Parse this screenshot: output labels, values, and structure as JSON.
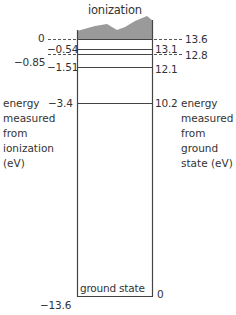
{
  "diagram": {
    "title": "ionization",
    "left_axis_label": [
      "energy",
      "measured",
      "from",
      "ionization",
      "(eV)"
    ],
    "right_axis_label": [
      "energy",
      "measured",
      "from",
      "ground",
      "state (eV)"
    ],
    "ground_state_label": "ground state",
    "levels": [
      {
        "left": "0",
        "right": "13.6",
        "dashed": true
      },
      {
        "left": "−0.54",
        "right": "13.1",
        "dashed": false
      },
      {
        "left": "−0.85",
        "right": "12.8",
        "dashed": true
      },
      {
        "left": "−1.51",
        "right": "12.1",
        "dashed": false
      },
      {
        "left": "−3.4",
        "right": "10.2",
        "dashed": false
      },
      {
        "left": "−13.6",
        "right": "0",
        "dashed": false
      }
    ],
    "colors": {
      "line": "#444444",
      "continuum": "#999999"
    }
  }
}
